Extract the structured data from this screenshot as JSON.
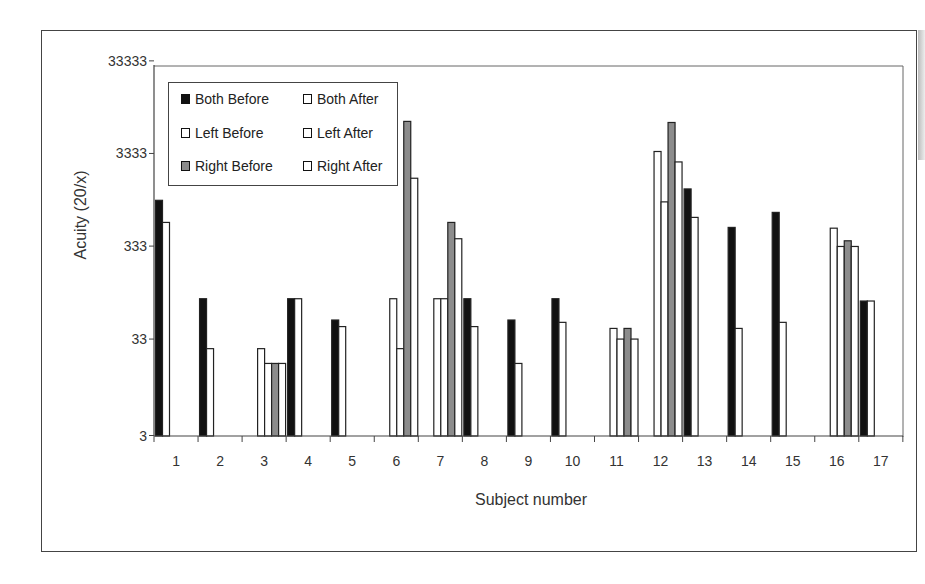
{
  "chart_data": {
    "type": "bar",
    "title": "",
    "xlabel": "Subject number",
    "ylabel": "Acuity (20/x)",
    "yscale": "log",
    "ylim": [
      3,
      33333
    ],
    "yticks": [
      "3",
      "33",
      "333",
      "3333",
      "33333"
    ],
    "ytick_values": [
      3,
      33,
      333,
      3333,
      33333
    ],
    "grid": false,
    "legend_position": "upper left (inside)",
    "categories": [
      "1",
      "2",
      "3",
      "4",
      "5",
      "6",
      "7",
      "8",
      "9",
      "10",
      "11",
      "12",
      "13",
      "14",
      "15",
      "16",
      "17"
    ],
    "series": [
      {
        "name": "Both Before",
        "color": "#111111",
        "values": [
          1040,
          90,
          null,
          90,
          53,
          null,
          null,
          90,
          53,
          90,
          null,
          null,
          1380,
          530,
          770,
          null,
          85
        ]
      },
      {
        "name": "Both After",
        "color": "#ffffff",
        "values": [
          600,
          26,
          null,
          90,
          45,
          null,
          null,
          45,
          18,
          50,
          null,
          null,
          680,
          43,
          50,
          null,
          85
        ]
      },
      {
        "name": "Left Before",
        "color": "#ffffff",
        "values": [
          null,
          null,
          26,
          null,
          null,
          90,
          90,
          null,
          null,
          null,
          43,
          3500,
          null,
          null,
          null,
          520,
          null
        ]
      },
      {
        "name": "Left After",
        "color": "#ffffff",
        "values": [
          null,
          null,
          18,
          null,
          null,
          26,
          90,
          null,
          null,
          null,
          33,
          1000,
          null,
          null,
          null,
          330,
          null
        ]
      },
      {
        "name": "Right Before",
        "color": "#8c8c8c",
        "values": [
          null,
          null,
          18,
          null,
          null,
          7400,
          600,
          null,
          null,
          null,
          43,
          7200,
          null,
          null,
          null,
          380,
          null
        ]
      },
      {
        "name": "Right After",
        "color": "#ffffff",
        "values": [
          null,
          null,
          18,
          null,
          null,
          1800,
          400,
          null,
          null,
          null,
          33,
          2700,
          null,
          null,
          null,
          330,
          null
        ]
      }
    ]
  },
  "legend": {
    "items": [
      {
        "label": "Both Before",
        "color": "#111111"
      },
      {
        "label": "Both After",
        "color": "#ffffff"
      },
      {
        "label": "Left Before",
        "color": "#ffffff"
      },
      {
        "label": "Left After",
        "color": "#ffffff"
      },
      {
        "label": "Right Before",
        "color": "#8c8c8c"
      },
      {
        "label": "Right After",
        "color": "#ffffff"
      }
    ]
  }
}
